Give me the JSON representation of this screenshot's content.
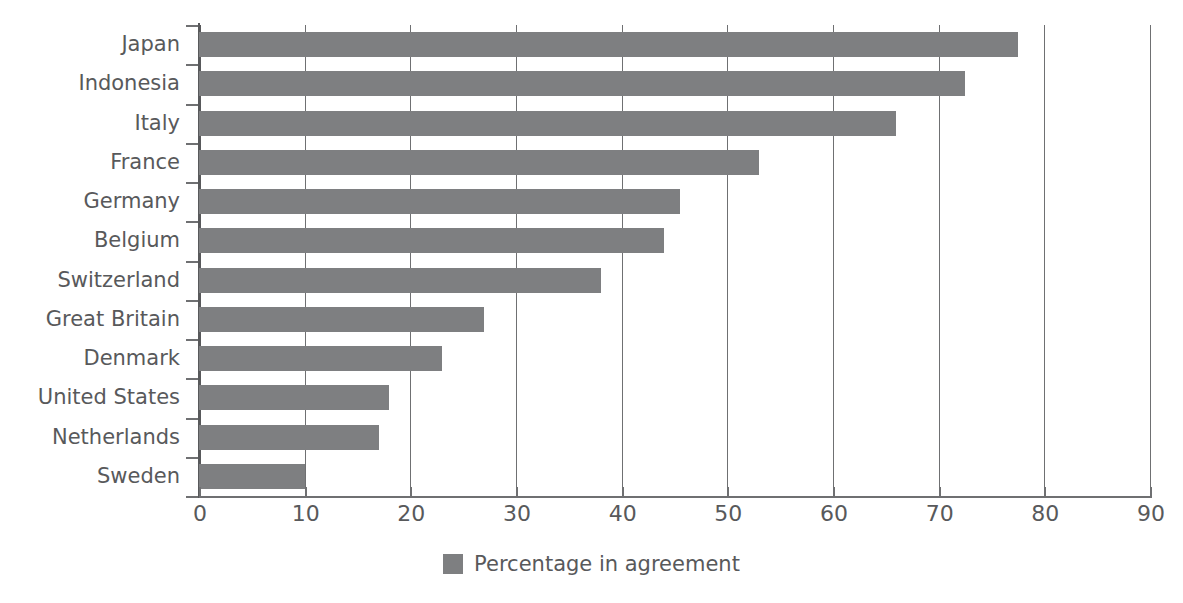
{
  "chart_data": {
    "type": "bar",
    "orientation": "horizontal",
    "title": "",
    "subtitle": "",
    "xlabel": "",
    "ylabel": "",
    "xlim": [
      0,
      90
    ],
    "xticks": [
      0,
      10,
      20,
      30,
      40,
      50,
      60,
      70,
      80,
      90
    ],
    "xtick_labels": [
      "0",
      "10",
      "20",
      "30",
      "40",
      "50",
      "60",
      "70",
      "80",
      "90"
    ],
    "grid": "vertical",
    "legend_position": "bottom-center",
    "categories": [
      "Japan",
      "Indonesia",
      "Italy",
      "France",
      "Germany",
      "Belgium",
      "Switzerland",
      "Great Britain",
      "Denmark",
      "United States",
      "Netherlands",
      "Sweden"
    ],
    "values": [
      77.5,
      72.5,
      66,
      53,
      45.5,
      44,
      38,
      27,
      23,
      18,
      17,
      10
    ],
    "series": [
      {
        "name": "Percentage in agreement",
        "color": "#7e7f81",
        "values": [
          77.5,
          72.5,
          66,
          53,
          45.5,
          44,
          38,
          27,
          23,
          18,
          17,
          10
        ]
      }
    ],
    "legend": [
      {
        "label": "Percentage in agreement",
        "color": "#7e7f81"
      }
    ],
    "colors": {
      "bar": "#7e7f81",
      "axis": "#58595b",
      "grid": "#6f7072",
      "text": "#58595b",
      "background": "#ffffff"
    }
  }
}
